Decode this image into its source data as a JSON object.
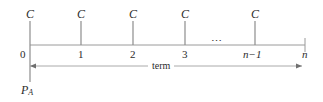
{
  "diagram": {
    "type": "cash-flow-timeline",
    "title": "",
    "axis": {
      "line_color": "#9a9a9a",
      "text_color": "#2b2b2b",
      "start_x": 30,
      "end_x": 305,
      "baseline_y": 45
    },
    "periods": [
      {
        "id": "t0",
        "tick_label": "0",
        "x": 30,
        "label_x": 20,
        "symbolic": false,
        "has_arrow": true,
        "arrow_label": "C"
      },
      {
        "id": "t1",
        "tick_label": "1",
        "x": 81,
        "label_x": 78,
        "symbolic": false,
        "has_arrow": true,
        "arrow_label": "C"
      },
      {
        "id": "t2",
        "tick_label": "2",
        "x": 133,
        "label_x": 130,
        "symbolic": false,
        "has_arrow": true,
        "arrow_label": "C"
      },
      {
        "id": "t3",
        "tick_label": "3",
        "x": 185,
        "label_x": 182,
        "symbolic": false,
        "has_arrow": true,
        "arrow_label": "C"
      },
      {
        "id": "tn1",
        "tick_label": "n−1",
        "x": 255,
        "label_x": 243,
        "symbolic": true,
        "has_arrow": true,
        "arrow_label": "C"
      },
      {
        "id": "tn",
        "tick_label": "n",
        "x": 305,
        "label_x": 302,
        "symbolic": true,
        "has_arrow": false,
        "arrow_label": ""
      }
    ],
    "ellipsis": {
      "text": "⋯",
      "x": 211,
      "y": 36
    },
    "cash_flow_symbol": "C",
    "span": {
      "label": "term",
      "left_x": 30,
      "right_x": 302,
      "y": 66
    },
    "present_worth": {
      "symbol": "P",
      "subscript": "A",
      "x": 21,
      "y": 84
    },
    "colors": {
      "line": "#9a9a9a",
      "text": "#2b2b2b",
      "background": "#ffffff"
    }
  }
}
